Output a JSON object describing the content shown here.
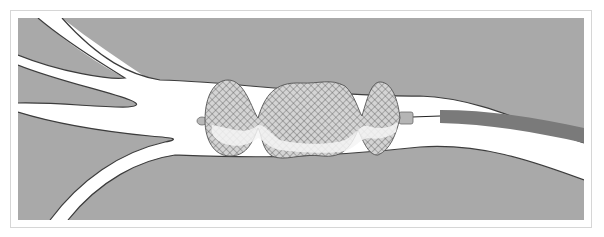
{
  "diagram": {
    "title": "",
    "colors": {
      "background": "#ffffff",
      "frame_border": "#d6d6d6",
      "tissue": "#a9a9a9",
      "vessel_lumen": "#ffffff",
      "vessel_wall_line": "#3c3c3c",
      "mesh_line": "#555555",
      "mesh_fill": "#c4c4c4",
      "catheter": "#7a7a7a",
      "connector": "#b5b5b5",
      "guidewire": "#222222"
    },
    "elements": [
      {
        "name": "vessel-branch-upper-left",
        "label": ""
      },
      {
        "name": "vessel-branch-lower-left",
        "label": ""
      },
      {
        "name": "vessel-main-trunk",
        "label": ""
      },
      {
        "name": "mesh-device",
        "lobes": 3,
        "label": ""
      },
      {
        "name": "proximal-tip",
        "label": ""
      },
      {
        "name": "distal-connector",
        "label": ""
      },
      {
        "name": "guidewire",
        "label": ""
      },
      {
        "name": "catheter",
        "label": ""
      }
    ]
  }
}
